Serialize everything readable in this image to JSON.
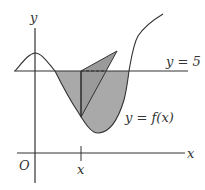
{
  "diagram": {
    "title": "",
    "labels": {
      "y_axis": "y",
      "x_axis": "x",
      "origin": "O",
      "x_tick": "x",
      "horizontal_line": "y = 5",
      "curve": "y = f(x)"
    },
    "colors": {
      "stroke": "#333333",
      "shaded_region": "#a9a9a9",
      "triangle": "#9a9a9a",
      "background": "#ffffff"
    }
  }
}
